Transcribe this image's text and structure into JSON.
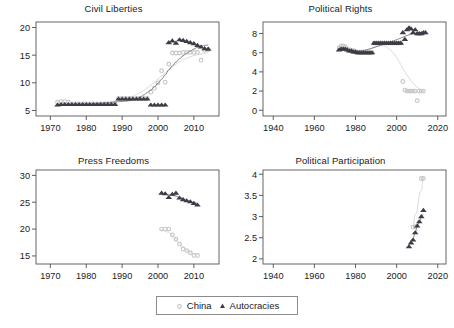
{
  "figure": {
    "width": 454,
    "height": 328,
    "background": "#ffffff",
    "layout": "2x2 small-multiples grid with shared legend below"
  },
  "legend": {
    "position": "bottom-center",
    "entries": [
      {
        "label": "China",
        "marker": "circle",
        "color": "#c8c8c8"
      },
      {
        "label": "Autocracies",
        "marker": "triangle",
        "color": "#3c3c46"
      }
    ]
  },
  "colors": {
    "china": "#c8c8c8",
    "china_line": "#d2d2d2",
    "autocracies": "#3c3c46",
    "autocracies_line": "#6e6e78",
    "axis": "#4d4d4d",
    "frame": "#555555",
    "text": "#1a1a1a"
  },
  "chart_data": [
    {
      "type": "scatter",
      "title": "Civil Liberties",
      "xlabel": "",
      "ylabel": "",
      "xlim": [
        1966,
        2017
      ],
      "ylim": [
        4.0,
        21.0
      ],
      "xticks": [
        1970,
        1980,
        1990,
        2000,
        2010
      ],
      "yticks": [
        5,
        10,
        15,
        20
      ],
      "grid": false,
      "series": [
        {
          "name": "China",
          "marker": "circle",
          "color": "#c8c8c8",
          "trend_line": true,
          "points": [
            [
              1972,
              6.5
            ],
            [
              1973,
              6.6
            ],
            [
              1974,
              6.6
            ],
            [
              1975,
              6.5
            ],
            [
              1976,
              6.2
            ],
            [
              1977,
              6.2
            ],
            [
              1978,
              6.2
            ],
            [
              1979,
              6.2
            ],
            [
              1980,
              6.2
            ],
            [
              1981,
              6.2
            ],
            [
              1982,
              6.2
            ],
            [
              1983,
              6.2
            ],
            [
              1984,
              6.2
            ],
            [
              1985,
              6.2
            ],
            [
              1986,
              6.2
            ],
            [
              1987,
              6.2
            ],
            [
              1988,
              6.2
            ],
            [
              1989,
              7.2
            ],
            [
              1990,
              7.2
            ],
            [
              1991,
              7.2
            ],
            [
              1992,
              7.2
            ],
            [
              1993,
              7.2
            ],
            [
              1994,
              7.2
            ],
            [
              1995,
              7.2
            ],
            [
              1996,
              7.2
            ],
            [
              1997,
              7.2
            ],
            [
              1998,
              8.3
            ],
            [
              1999,
              9.0
            ],
            [
              2000,
              10.0
            ],
            [
              2001,
              12.2
            ],
            [
              2002,
              10.1
            ],
            [
              2003,
              13.4
            ],
            [
              2004,
              15.4
            ],
            [
              2005,
              15.4
            ],
            [
              2006,
              15.4
            ],
            [
              2007,
              15.5
            ],
            [
              2008,
              15.5
            ],
            [
              2009,
              15.5
            ],
            [
              2010,
              15.5
            ],
            [
              2011,
              15.5
            ],
            [
              2012,
              14.1
            ],
            [
              2013,
              15.9
            ],
            [
              2014,
              16.0
            ]
          ]
        },
        {
          "name": "Autocracies",
          "marker": "triangle",
          "color": "#3c3c46",
          "trend_line": true,
          "points": [
            [
              1972,
              6.0
            ],
            [
              1973,
              6.1
            ],
            [
              1974,
              6.1
            ],
            [
              1975,
              6.1
            ],
            [
              1976,
              6.1
            ],
            [
              1977,
              6.1
            ],
            [
              1978,
              6.1
            ],
            [
              1979,
              6.1
            ],
            [
              1980,
              6.1
            ],
            [
              1981,
              6.1
            ],
            [
              1982,
              6.1
            ],
            [
              1983,
              6.1
            ],
            [
              1984,
              6.1
            ],
            [
              1985,
              6.1
            ],
            [
              1986,
              6.1
            ],
            [
              1987,
              6.1
            ],
            [
              1988,
              6.1
            ],
            [
              1989,
              7.1
            ],
            [
              1990,
              7.1
            ],
            [
              1991,
              7.1
            ],
            [
              1992,
              7.1
            ],
            [
              1993,
              7.1
            ],
            [
              1994,
              7.1
            ],
            [
              1995,
              7.1
            ],
            [
              1996,
              7.1
            ],
            [
              1997,
              7.1
            ],
            [
              1998,
              6.0
            ],
            [
              1999,
              6.0
            ],
            [
              2000,
              6.0
            ],
            [
              2001,
              6.0
            ],
            [
              2002,
              6.0
            ],
            [
              2003,
              17.3
            ],
            [
              2004,
              17.6
            ],
            [
              2005,
              17.2
            ],
            [
              2006,
              17.8
            ],
            [
              2007,
              17.7
            ],
            [
              2008,
              17.5
            ],
            [
              2009,
              17.3
            ],
            [
              2010,
              17.1
            ],
            [
              2011,
              16.8
            ],
            [
              2012,
              16.5
            ],
            [
              2013,
              16.2
            ],
            [
              2014,
              16.1
            ]
          ]
        }
      ]
    },
    {
      "type": "scatter",
      "title": "Political Rights",
      "xlabel": "",
      "ylabel": "",
      "xlim": [
        1935,
        2024
      ],
      "ylim": [
        -0.6,
        9.2
      ],
      "xticks": [
        1940,
        1960,
        1980,
        2000,
        2020
      ],
      "yticks": [
        0,
        2,
        4,
        6,
        8
      ],
      "grid": false,
      "series": [
        {
          "name": "China",
          "marker": "circle",
          "color": "#c8c8c8",
          "trend_line": true,
          "points": [
            [
              1972,
              6.5
            ],
            [
              1973,
              6.7
            ],
            [
              1974,
              6.7
            ],
            [
              1975,
              6.6
            ],
            [
              1976,
              6.4
            ],
            [
              1977,
              6.3
            ],
            [
              1978,
              6.2
            ],
            [
              1979,
              6.2
            ],
            [
              1980,
              6.1
            ],
            [
              1981,
              6.0
            ],
            [
              1982,
              6.0
            ],
            [
              1983,
              6.0
            ],
            [
              1984,
              6.0
            ],
            [
              1985,
              6.0
            ],
            [
              1986,
              6.0
            ],
            [
              1987,
              6.0
            ],
            [
              1988,
              6.0
            ],
            [
              1989,
              7.0
            ],
            [
              1990,
              7.0
            ],
            [
              1991,
              7.0
            ],
            [
              1992,
              7.0
            ],
            [
              1993,
              7.0
            ],
            [
              1994,
              7.0
            ],
            [
              1995,
              7.0
            ],
            [
              1996,
              7.0
            ],
            [
              1997,
              7.0
            ],
            [
              1998,
              7.0
            ],
            [
              1999,
              7.0
            ],
            [
              2000,
              7.0
            ],
            [
              2001,
              7.0
            ],
            [
              2002,
              7.0
            ],
            [
              2003,
              3.0
            ],
            [
              2004,
              2.1
            ],
            [
              2005,
              2.0
            ],
            [
              2006,
              2.0
            ],
            [
              2007,
              2.0
            ],
            [
              2008,
              2.0
            ],
            [
              2009,
              2.0
            ],
            [
              2010,
              1.0
            ],
            [
              2011,
              2.0
            ],
            [
              2012,
              2.0
            ],
            [
              2013,
              2.0
            ]
          ]
        },
        {
          "name": "Autocracies",
          "marker": "triangle",
          "color": "#3c3c46",
          "trend_line": true,
          "points": [
            [
              1972,
              6.3
            ],
            [
              1973,
              6.4
            ],
            [
              1974,
              6.4
            ],
            [
              1975,
              6.4
            ],
            [
              1976,
              6.3
            ],
            [
              1977,
              6.2
            ],
            [
              1978,
              6.2
            ],
            [
              1979,
              6.1
            ],
            [
              1980,
              6.1
            ],
            [
              1981,
              6.0
            ],
            [
              1982,
              6.0
            ],
            [
              1983,
              6.0
            ],
            [
              1984,
              6.0
            ],
            [
              1985,
              6.0
            ],
            [
              1986,
              6.0
            ],
            [
              1987,
              6.0
            ],
            [
              1988,
              6.0
            ],
            [
              1989,
              7.0
            ],
            [
              1990,
              7.0
            ],
            [
              1991,
              7.0
            ],
            [
              1992,
              7.0
            ],
            [
              1993,
              7.0
            ],
            [
              1994,
              7.0
            ],
            [
              1995,
              7.0
            ],
            [
              1996,
              7.0
            ],
            [
              1997,
              7.0
            ],
            [
              1998,
              7.0
            ],
            [
              1999,
              7.0
            ],
            [
              2000,
              7.0
            ],
            [
              2001,
              7.0
            ],
            [
              2002,
              7.0
            ],
            [
              2003,
              8.1
            ],
            [
              2004,
              7.4
            ],
            [
              2005,
              8.4
            ],
            [
              2006,
              8.6
            ],
            [
              2007,
              8.5
            ],
            [
              2008,
              8.1
            ],
            [
              2009,
              8.4
            ],
            [
              2010,
              8.0
            ],
            [
              2011,
              8.0
            ],
            [
              2012,
              8.0
            ],
            [
              2013,
              8.1
            ],
            [
              2014,
              8.1
            ]
          ]
        }
      ]
    },
    {
      "type": "scatter",
      "title": "Press Freedoms",
      "xlabel": "",
      "ylabel": "",
      "xlim": [
        1966,
        2017
      ],
      "ylim": [
        13.5,
        31.0
      ],
      "xticks": [
        1970,
        1980,
        1990,
        2000,
        2010
      ],
      "yticks": [
        15,
        20,
        25,
        30
      ],
      "grid": false,
      "series": [
        {
          "name": "China",
          "marker": "circle",
          "color": "#c8c8c8",
          "trend_line": true,
          "points": [
            [
              2001,
              20.0
            ],
            [
              2002,
              20.0
            ],
            [
              2003,
              20.0
            ],
            [
              2004,
              18.9
            ],
            [
              2005,
              18.1
            ],
            [
              2006,
              17.2
            ],
            [
              2007,
              16.3
            ],
            [
              2008,
              16.0
            ],
            [
              2009,
              15.6
            ],
            [
              2010,
              15.1
            ],
            [
              2011,
              15.1
            ]
          ]
        },
        {
          "name": "Autocracies",
          "marker": "triangle",
          "color": "#3c3c46",
          "trend_line": true,
          "points": [
            [
              2001,
              26.7
            ],
            [
              2002,
              26.6
            ],
            [
              2003,
              25.9
            ],
            [
              2004,
              26.5
            ],
            [
              2005,
              26.7
            ],
            [
              2006,
              25.8
            ],
            [
              2007,
              25.5
            ],
            [
              2008,
              25.3
            ],
            [
              2009,
              25.1
            ],
            [
              2010,
              24.8
            ],
            [
              2011,
              24.5
            ]
          ]
        }
      ]
    },
    {
      "type": "scatter",
      "title": "Political Participation",
      "xlabel": "",
      "ylabel": "",
      "xlim": [
        1935,
        2024
      ],
      "ylim": [
        1.88,
        4.1
      ],
      "xticks": [
        1940,
        1960,
        1980,
        2000,
        2020
      ],
      "yticks": [
        2,
        2.5,
        3,
        3.5,
        4
      ],
      "ytick_labels": [
        "2",
        "2.5",
        "3",
        "3.5",
        "4"
      ],
      "grid": false,
      "series": [
        {
          "name": "China",
          "marker": "circle",
          "color": "#c8c8c8",
          "trend_line": true,
          "points": [
            [
              2008,
              2.75
            ],
            [
              2009,
              2.76
            ],
            [
              2012,
              3.9
            ],
            [
              2013,
              3.9
            ]
          ]
        },
        {
          "name": "Autocracies",
          "marker": "triangle",
          "color": "#3c3c46",
          "trend_line": true,
          "points": [
            [
              2006,
              2.29
            ],
            [
              2007,
              2.38
            ],
            [
              2008,
              2.45
            ],
            [
              2009,
              2.62
            ],
            [
              2010,
              2.78
            ],
            [
              2011,
              2.88
            ],
            [
              2012,
              3.0
            ],
            [
              2013,
              3.15
            ]
          ]
        }
      ]
    }
  ]
}
